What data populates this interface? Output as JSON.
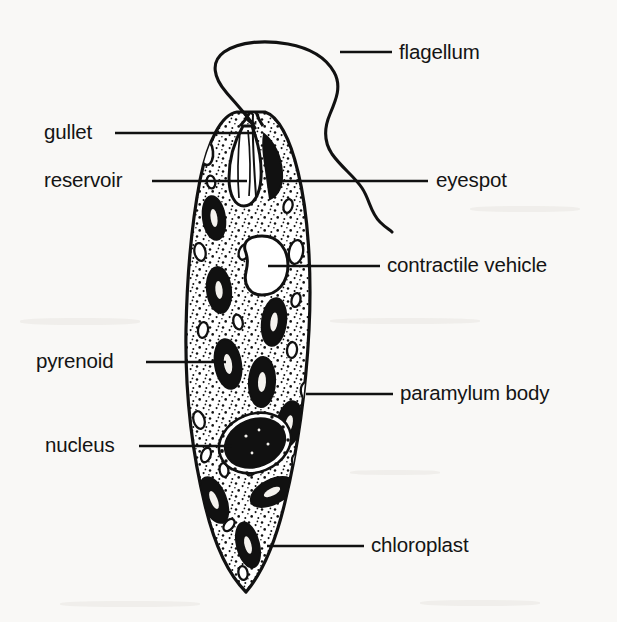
{
  "figure": {
    "type": "labelled-biological-diagram",
    "background_color": "#f9f8f6",
    "ink_color": "#111111",
    "width": 617,
    "height": 622
  },
  "labels": [
    {
      "id": "flagellum",
      "text": "flagellum",
      "side": "right",
      "text_x": 399,
      "text_y": 42,
      "leader": {
        "x1": 340,
        "y1": 52,
        "x2": 392,
        "y2": 52
      }
    },
    {
      "id": "gullet",
      "text": "gullet",
      "side": "left",
      "text_x": 44,
      "text_y": 122,
      "leader": {
        "x1": 115,
        "y1": 133,
        "x2": 256,
        "y2": 133
      }
    },
    {
      "id": "reservoir",
      "text": "reservoir",
      "side": "left",
      "text_x": 44,
      "text_y": 170,
      "leader": {
        "x1": 152,
        "y1": 181,
        "x2": 247,
        "y2": 181
      }
    },
    {
      "id": "eyespot",
      "text": "eyespot",
      "side": "right",
      "text_x": 436,
      "text_y": 170,
      "leader": {
        "x1": 281,
        "y1": 181,
        "x2": 428,
        "y2": 181
      }
    },
    {
      "id": "contractile-vehicle",
      "text": "contractile vehicle",
      "side": "right",
      "text_x": 387,
      "text_y": 255,
      "leader": {
        "x1": 268,
        "y1": 266,
        "x2": 380,
        "y2": 266
      }
    },
    {
      "id": "pyrenoid",
      "text": "pyrenoid",
      "side": "left",
      "text_x": 36,
      "text_y": 351,
      "leader": {
        "x1": 146,
        "y1": 362,
        "x2": 226,
        "y2": 362
      }
    },
    {
      "id": "paramylum-body",
      "text": "paramylum body",
      "side": "right",
      "text_x": 400,
      "text_y": 383,
      "leader": {
        "x1": 306,
        "y1": 394,
        "x2": 393,
        "y2": 394
      }
    },
    {
      "id": "nucleus",
      "text": "nucleus",
      "side": "left",
      "text_x": 45,
      "text_y": 435,
      "leader": {
        "x1": 139,
        "y1": 446,
        "x2": 232,
        "y2": 446
      }
    },
    {
      "id": "chloroplast",
      "text": "chloroplast",
      "side": "right",
      "text_x": 371,
      "text_y": 535,
      "leader": {
        "x1": 267,
        "y1": 546,
        "x2": 364,
        "y2": 546
      }
    }
  ],
  "structures": {
    "cell_body": {
      "name": "cell-body-outline",
      "apex_y": 112,
      "posterior_tip": {
        "x": 246,
        "y": 592
      },
      "widest": {
        "left_x": 186,
        "right_x": 311,
        "y": 330
      }
    },
    "flagellum": {
      "name": "flagellum-path",
      "origin": {
        "x": 255,
        "y": 128
      },
      "end": {
        "x": 392,
        "y": 232
      }
    },
    "reservoir": {
      "name": "reservoir-vesicle",
      "cx": 246,
      "cy": 170
    },
    "gullet": {
      "name": "gullet-canal",
      "cx": 255,
      "cy": 128
    },
    "eyespot": {
      "name": "eyespot-stigma",
      "cx": 274,
      "cy": 172,
      "fill": "#111111"
    },
    "contractile_vacuole": {
      "name": "contractile-vacuole",
      "cx": 265,
      "cy": 265
    },
    "nucleus": {
      "name": "nucleus-organelle",
      "cx": 255,
      "cy": 443,
      "fill": "#111111"
    },
    "chloroplast_count": 11,
    "paramylum_count": 16
  }
}
